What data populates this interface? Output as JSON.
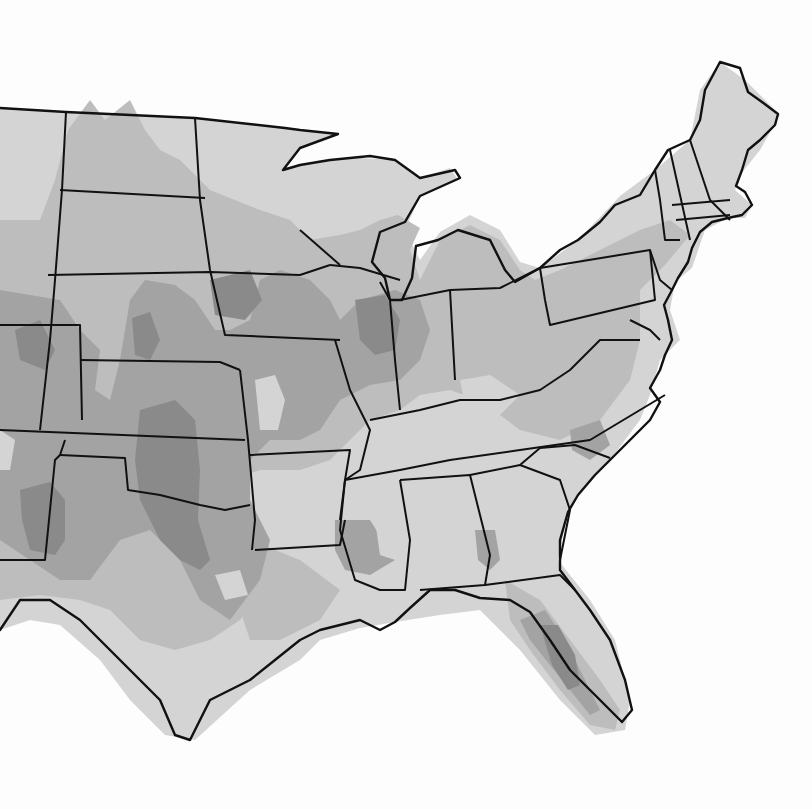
{
  "map": {
    "type": "contour-choropleth",
    "region": "Contiguous United States (central and eastern portion)",
    "color_scheme": "grayscale",
    "levels": [
      {
        "level": 0,
        "color": "#ffffff",
        "meaning": "outside / no data"
      },
      {
        "level": 1,
        "color": "#d4d4d4",
        "meaning": "lowest shaded class"
      },
      {
        "level": 2,
        "color": "#bdbdbd",
        "meaning": "low-mid class"
      },
      {
        "level": 3,
        "color": "#a3a3a3",
        "meaning": "mid-high class"
      },
      {
        "level": 4,
        "color": "#8a8a8a",
        "meaning": "highest class"
      }
    ],
    "outline_color": "#111111",
    "hotspots": [
      {
        "area": "Western Kansas / Oklahoma panhandle",
        "level": 4
      },
      {
        "area": "Eastern New Mexico",
        "level": 4
      },
      {
        "area": "North-central Texas",
        "level": 4
      },
      {
        "area": "Central Illinois",
        "level": 4
      },
      {
        "area": "Central Florida",
        "level": 4
      },
      {
        "area": "Southern Minnesota / Iowa",
        "level": 3
      },
      {
        "area": "Western Mississippi",
        "level": 3
      },
      {
        "area": "Western Georgia",
        "level": 3
      }
    ],
    "legend_visible": false,
    "title_visible": false
  }
}
